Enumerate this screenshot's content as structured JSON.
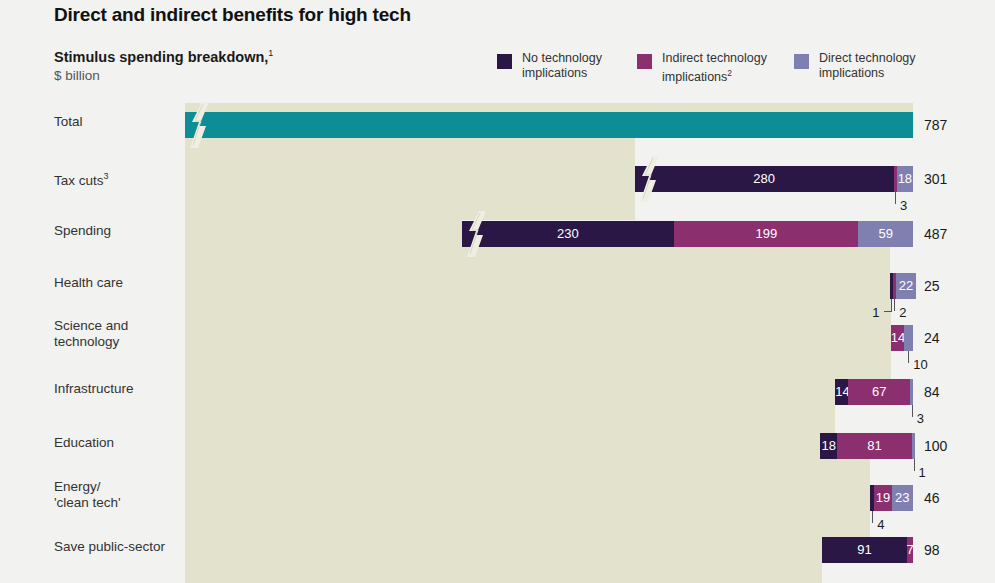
{
  "header": {
    "title": "Direct and indirect benefits for high tech",
    "subtitle": "Stimulus spending breakdown,",
    "subtitle_footnote": "1",
    "units": "$ billion"
  },
  "legend": {
    "items": [
      {
        "label_line1": "No technology",
        "label_line2": "implications",
        "footnote": "",
        "color": "#2b1745",
        "key": "none"
      },
      {
        "label_line1": "Indirect technology",
        "label_line2": "implications",
        "footnote": "2",
        "color": "#8b2f6e",
        "key": "indirect"
      },
      {
        "label_line1": "Direct technology",
        "label_line2": "implications",
        "footnote": "",
        "color": "#7f7fb0",
        "key": "direct"
      }
    ]
  },
  "chart_data": {
    "type": "bar",
    "subtype": "stacked-cascade",
    "xlabel": "",
    "ylabel": "",
    "series": [
      {
        "name": "No technology implications",
        "color": "#2b1745",
        "values": [
          787,
          280,
          230,
          1,
          0,
          14,
          18,
          4,
          91
        ]
      },
      {
        "name": "Indirect technology implications",
        "color": "#8b2f6e",
        "values": [
          0,
          3,
          199,
          2,
          14,
          67,
          81,
          19,
          7
        ]
      },
      {
        "name": "Direct technology implications",
        "color": "#7f7fb0",
        "values": [
          0,
          18,
          59,
          22,
          10,
          3,
          1,
          23,
          0
        ]
      }
    ],
    "categories": [
      "Total",
      "Tax cuts",
      "Spending",
      "Health care",
      "Science and technology",
      "Infrastructure",
      "Education",
      "Energy/'clean tech'",
      "Save public-sector"
    ],
    "totals": [
      787,
      301,
      487,
      25,
      24,
      84,
      100,
      46,
      98
    ],
    "rows": [
      {
        "label": "Total",
        "label_footnote": "",
        "label_line2": "",
        "total": "787",
        "highlight": "teal",
        "segments": [
          {
            "key": "teal",
            "value": "787",
            "show_label": false
          }
        ],
        "callouts": []
      },
      {
        "label": "Tax cuts",
        "label_footnote": "3",
        "label_line2": "",
        "total": "301",
        "segments": [
          {
            "key": "none",
            "value": "280",
            "show_label": true
          },
          {
            "key": "indirect",
            "value": "3",
            "show_label": false
          },
          {
            "key": "direct",
            "value": "18",
            "show_label": true
          }
        ],
        "callouts": [
          {
            "value": "3",
            "segment": 1
          }
        ]
      },
      {
        "label": "Spending",
        "label_footnote": "",
        "label_line2": "",
        "total": "487",
        "segments": [
          {
            "key": "none",
            "value": "230",
            "show_label": true
          },
          {
            "key": "indirect",
            "value": "199",
            "show_label": true
          },
          {
            "key": "direct",
            "value": "59",
            "show_label": true
          }
        ],
        "callouts": []
      },
      {
        "label": "Health care",
        "label_footnote": "",
        "label_line2": "",
        "total": "25",
        "segments": [
          {
            "key": "none",
            "value": "1",
            "show_label": false
          },
          {
            "key": "indirect",
            "value": "2",
            "show_label": false
          },
          {
            "key": "direct",
            "value": "22",
            "show_label": true
          }
        ],
        "callouts": [
          {
            "value": "1",
            "segment": 0
          },
          {
            "value": "2",
            "segment": 1
          }
        ]
      },
      {
        "label": "Science and",
        "label_footnote": "",
        "label_line2": "technology",
        "total": "24",
        "segments": [
          {
            "key": "indirect",
            "value": "14",
            "show_label": true
          },
          {
            "key": "direct",
            "value": "10",
            "show_label": false
          }
        ],
        "callouts": [
          {
            "value": "10",
            "segment": 1
          }
        ]
      },
      {
        "label": "Infrastructure",
        "label_footnote": "",
        "label_line2": "",
        "total": "84",
        "segments": [
          {
            "key": "none",
            "value": "14",
            "show_label": true
          },
          {
            "key": "indirect",
            "value": "67",
            "show_label": true
          },
          {
            "key": "direct",
            "value": "3",
            "show_label": false
          }
        ],
        "callouts": [
          {
            "value": "3",
            "segment": 2
          }
        ]
      },
      {
        "label": "Education",
        "label_footnote": "",
        "label_line2": "",
        "total": "100",
        "segments": [
          {
            "key": "none",
            "value": "18",
            "show_label": true
          },
          {
            "key": "indirect",
            "value": "81",
            "show_label": true
          },
          {
            "key": "direct",
            "value": "1",
            "show_label": false
          }
        ],
        "callouts": [
          {
            "value": "1",
            "segment": 2
          }
        ]
      },
      {
        "label": "Energy/",
        "label_footnote": "",
        "label_line2": "'clean tech'",
        "total": "46",
        "segments": [
          {
            "key": "none",
            "value": "4",
            "show_label": false
          },
          {
            "key": "indirect",
            "value": "19",
            "show_label": true
          },
          {
            "key": "direct",
            "value": "23",
            "show_label": true
          }
        ],
        "callouts": [
          {
            "value": "4",
            "segment": 0
          }
        ]
      },
      {
        "label": "Save public-sector",
        "label_footnote": "",
        "label_line2": "",
        "total": "98",
        "segments": [
          {
            "key": "none",
            "value": "91",
            "show_label": true
          },
          {
            "key": "indirect",
            "value": "7",
            "show_label": true
          }
        ],
        "callouts": []
      }
    ]
  }
}
